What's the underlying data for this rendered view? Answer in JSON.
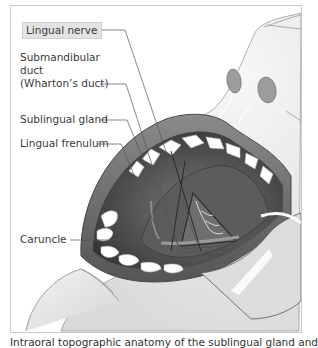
{
  "figure": {
    "labels": [
      {
        "id": "lingual-nerve",
        "text": "Lingual nerve",
        "boxed": true
      },
      {
        "id": "submandibular-duct",
        "lines": [
          "Submandibular",
          "duct",
          "(Wharton’s duct)"
        ]
      },
      {
        "id": "sublingual-gland",
        "text": "Sublingual gland"
      },
      {
        "id": "lingual-frenulum",
        "text": "Lingual frenulum"
      },
      {
        "id": "caruncle",
        "text": "Caruncle"
      }
    ],
    "caption": "Intraoral topographic anatomy of the sublingual gland and"
  },
  "colors": {
    "frame_border": "#c8c8c8",
    "label_box": "#e3e3e3",
    "skin": "#e9e9e9",
    "lip": "#6a6a6a",
    "mouth_interior": "#3c3c3c",
    "teeth": "#ffffff",
    "leader_line": "#555555"
  }
}
